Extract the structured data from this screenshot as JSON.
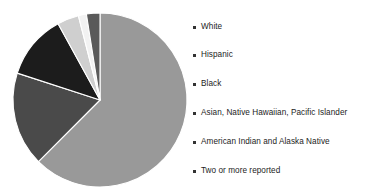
{
  "chart_data": {
    "type": "pie",
    "title": "",
    "subtitle": "",
    "xlabel": "",
    "ylabel": "",
    "legend_position": "right",
    "grid": false,
    "start_angle_deg": 0,
    "direction": "clockwise",
    "categories": [
      "White",
      "Hispanic",
      "Black",
      "Asian, Native Hawaiian, Pacific Islander",
      "American Indian and Alaska Native",
      "Two or more reported"
    ],
    "values": [
      62.5,
      17.5,
      12.0,
      4.0,
      1.5,
      2.5
    ],
    "colors": [
      "#999999",
      "#4a4a4a",
      "#1c1c1c",
      "#cfcfcf",
      "#f2f2f2",
      "#5a5a5a"
    ],
    "slices": [
      {
        "label": "White",
        "value": 62.5,
        "color": "#999999"
      },
      {
        "label": "Hispanic",
        "value": 17.5,
        "color": "#4a4a4a"
      },
      {
        "label": "Black",
        "value": 12.0,
        "color": "#1c1c1c"
      },
      {
        "label": "Asian, Native Hawaiian, Pacific Islander",
        "value": 4.0,
        "color": "#cfcfcf"
      },
      {
        "label": "American Indian and Alaska Native",
        "value": 1.5,
        "color": "#f2f2f2"
      },
      {
        "label": "Two or more reported",
        "value": 2.5,
        "color": "#5a5a5a"
      }
    ]
  },
  "legend": {
    "marker_color": "#333333",
    "items": [
      {
        "label": "White",
        "marker": "square-bullet"
      },
      {
        "label": "Hispanic",
        "marker": "square-bullet"
      },
      {
        "label": "Black",
        "marker": "square-bullet"
      },
      {
        "label": "Asian, Native Hawaiian, Pacific Islander",
        "marker": "square-bullet"
      },
      {
        "label": "American Indian and Alaska Native",
        "marker": "square-bullet"
      },
      {
        "label": "Two or more reported",
        "marker": "square-bullet"
      }
    ]
  },
  "pie_geometry": {
    "center_x": 100,
    "center_y": 100,
    "radius": 87
  }
}
